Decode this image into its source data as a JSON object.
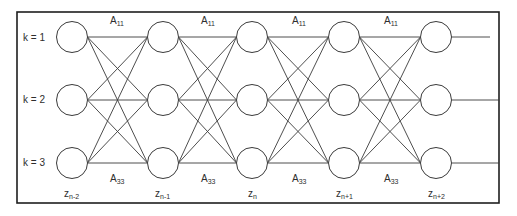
{
  "diagram": {
    "type": "trellis",
    "state_rows": [
      {
        "k_label": "k = 1"
      },
      {
        "k_label": "k = 2"
      },
      {
        "k_label": "k = 3"
      }
    ],
    "time_columns": [
      {
        "var": "z",
        "sub": "n-2"
      },
      {
        "var": "z",
        "sub": "n-1"
      },
      {
        "var": "z",
        "sub": "n"
      },
      {
        "var": "z",
        "sub": "n+1"
      },
      {
        "var": "z",
        "sub": "n+2"
      }
    ],
    "transition_labels": {
      "top": {
        "var": "A",
        "sub": "11"
      },
      "bottom": {
        "var": "A",
        "sub": "33"
      }
    },
    "colors": {
      "stroke": "#3a3a3a",
      "frame": "#1e1e1e",
      "background": "#ffffff"
    }
  }
}
